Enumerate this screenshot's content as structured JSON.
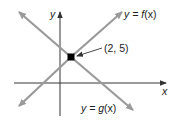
{
  "diagram": {
    "type": "intersecting-lines",
    "axes": {
      "x_label": "x",
      "y_label": "y"
    },
    "lines": [
      {
        "name": "f",
        "label": "y = f(x)",
        "label_prefix": "y = ",
        "label_func": "f",
        "label_arg": "(x)",
        "direction": "increasing",
        "color": "#9a9a9a"
      },
      {
        "name": "g",
        "label": "y = g(x)",
        "label_prefix": "y = ",
        "label_func": "g",
        "label_arg": "(x)",
        "direction": "decreasing",
        "color": "#9a9a9a"
      }
    ],
    "intersection": {
      "label": "(2, 5)",
      "x": 2,
      "y": 5
    },
    "colors": {
      "axes": "#333333",
      "lines": "#9a9a9a",
      "point": "#000000",
      "text": "#222222"
    }
  }
}
